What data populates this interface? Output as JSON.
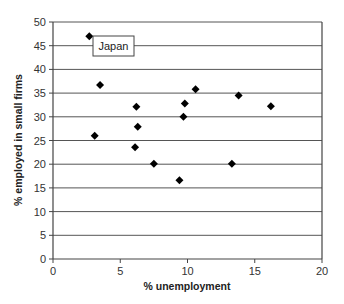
{
  "chart_data": {
    "type": "scatter",
    "title": "",
    "xlabel": "% unemployment",
    "ylabel": "% employed in small firms",
    "xlim": [
      0,
      20
    ],
    "ylim": [
      0,
      50
    ],
    "xticks": [
      0,
      5,
      10,
      15,
      20
    ],
    "yticks": [
      0,
      5,
      10,
      15,
      20,
      25,
      30,
      35,
      40,
      45,
      50
    ],
    "grid": {
      "horizontal": true,
      "vertical": false
    },
    "legend": null,
    "marker": "diamond",
    "marker_color": "#000000",
    "series": [
      {
        "name": "Countries",
        "points": [
          {
            "x": 2.7,
            "y": 47.0,
            "label": "Japan"
          },
          {
            "x": 3.5,
            "y": 36.7
          },
          {
            "x": 3.1,
            "y": 26.0
          },
          {
            "x": 6.2,
            "y": 32.1
          },
          {
            "x": 6.3,
            "y": 27.9
          },
          {
            "x": 6.1,
            "y": 23.6
          },
          {
            "x": 7.5,
            "y": 20.1
          },
          {
            "x": 9.4,
            "y": 16.6
          },
          {
            "x": 9.7,
            "y": 30.0
          },
          {
            "x": 9.8,
            "y": 32.8
          },
          {
            "x": 10.6,
            "y": 35.8
          },
          {
            "x": 13.8,
            "y": 34.5
          },
          {
            "x": 13.3,
            "y": 20.1
          },
          {
            "x": 16.2,
            "y": 32.2
          }
        ]
      }
    ],
    "annotations": [
      {
        "text": "Japan",
        "x": 3.0,
        "y": 45.0,
        "boxed": true
      }
    ]
  },
  "colors": {
    "background": "#ffffff",
    "gridline": "#555555",
    "axis": "#444444",
    "marker": "#000000"
  }
}
